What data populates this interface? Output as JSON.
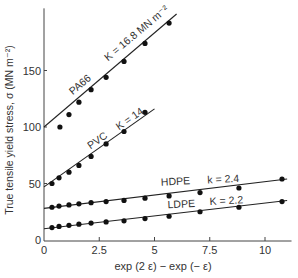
{
  "chart_data": {
    "type": "scatter",
    "title": "",
    "xlabel": "exp (2 ε) − exp (− ε)",
    "ylabel": "True tensile yield stress, σ (MN m⁻²)",
    "xlim": [
      0,
      11.2
    ],
    "ylim": [
      0,
      205
    ],
    "x_ticks": [
      0,
      2.5,
      5,
      7.5,
      10
    ],
    "x_tick_labels": [
      "0",
      "2.5",
      "5",
      "7.5",
      "10"
    ],
    "y_ticks": [
      0,
      50,
      100,
      150
    ],
    "y_tick_labels": [
      "0",
      "50",
      "100",
      "150"
    ],
    "grid": false,
    "legend": "inline labels",
    "series": [
      {
        "name": "PA66",
        "label": "PA66",
        "k_label": "K = 16.8 MN m⁻²",
        "fit": {
          "x0": 0,
          "y0": 100,
          "x1": 6.0,
          "y1": 200
        },
        "x": [
          0.72,
          1.13,
          1.58,
          2.13,
          2.81,
          3.62,
          4.57,
          5.66
        ],
        "y": [
          100,
          111,
          122,
          133,
          144,
          158,
          174,
          192
        ]
      },
      {
        "name": "PVC",
        "label": "PVC",
        "k_label": "K = 14",
        "fit": {
          "x0": 0,
          "y0": 47,
          "x1": 5.0,
          "y1": 116
        },
        "x": [
          0.36,
          0.68,
          1.13,
          1.58,
          2.13,
          2.81,
          3.62,
          4.57
        ],
        "y": [
          50,
          55,
          60,
          66,
          74,
          85,
          96,
          113
        ]
      },
      {
        "name": "HDPE",
        "label": "HDPE",
        "k_label": "k = 2.4",
        "fit": {
          "x0": 0,
          "y0": 28,
          "x1": 11.0,
          "y1": 54
        },
        "x": [
          0.36,
          0.68,
          1.13,
          1.58,
          2.13,
          2.81,
          3.62,
          4.57,
          5.66,
          7.06,
          8.82,
          10.77
        ],
        "y": [
          29,
          30,
          31,
          32,
          33,
          34,
          35,
          37,
          39,
          42,
          46,
          54
        ]
      },
      {
        "name": "LDPE",
        "label": "LDPE",
        "k_label": "K = 2.2",
        "fit": {
          "x0": 0,
          "y0": 10,
          "x1": 11.0,
          "y1": 35
        },
        "x": [
          0.36,
          0.68,
          1.13,
          1.58,
          2.13,
          2.81,
          3.62,
          4.57,
          5.66,
          7.06,
          8.82,
          10.77
        ],
        "y": [
          11,
          12,
          13,
          14,
          15,
          16,
          17,
          19,
          21,
          25,
          29,
          34
        ]
      }
    ],
    "label_positions": {
      "PA66": {
        "x": 1.3,
        "y": 128,
        "angle": -40
      },
      "PA66_k": {
        "x": 2.9,
        "y": 158,
        "angle": -40
      },
      "PVC": {
        "x": 2.1,
        "y": 80,
        "angle": -35
      },
      "PVC_k": {
        "x": 3.4,
        "y": 97,
        "angle": -35
      },
      "HDPE": {
        "x": 5.3,
        "y": 48,
        "angle": -3
      },
      "HDPE_k": {
        "x": 7.4,
        "y": 50,
        "angle": -3
      },
      "LDPE": {
        "x": 5.6,
        "y": 28,
        "angle": -3
      },
      "LDPE_k": {
        "x": 7.5,
        "y": 31,
        "angle": -3
      }
    }
  }
}
